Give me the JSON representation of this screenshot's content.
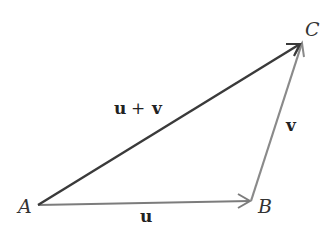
{
  "diagram": {
    "points": {
      "A": {
        "label": "A",
        "x": 38,
        "y": 205
      },
      "B": {
        "label": "B",
        "x": 251,
        "y": 201
      },
      "C": {
        "label": "C",
        "x": 302,
        "y": 42
      }
    },
    "vectors": [
      {
        "id": "u",
        "label": "u",
        "from": "A",
        "to": "B",
        "color": "#7a7a7a"
      },
      {
        "id": "v",
        "label": "v",
        "from": "B",
        "to": "C",
        "color": "#8a8a8a"
      },
      {
        "id": "sum",
        "label_left": "u",
        "label_op": "+",
        "label_right": "v",
        "from": "A",
        "to": "C",
        "color": "#3a3a3a"
      }
    ]
  }
}
